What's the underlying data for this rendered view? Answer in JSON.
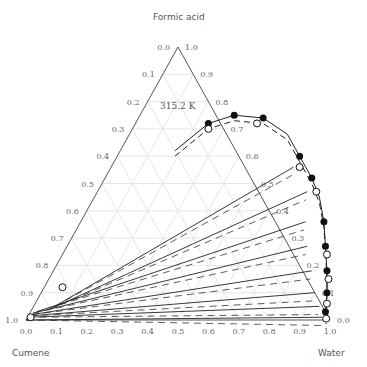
{
  "chart_data": {
    "type": "ternary-phase-diagram",
    "title": "",
    "temperature_label": "315.2 K",
    "vertices": {
      "top": "Formic acid",
      "left": "Cumene",
      "right": "Water"
    },
    "axes": {
      "bottom": {
        "ticks": [
          "0.0",
          "0.1",
          "0.2",
          "0.3",
          "0.4",
          "0.5",
          "0.6",
          "0.7",
          "0.8",
          "0.9",
          "1.0"
        ]
      },
      "left": {
        "ticks": [
          "0.0",
          "0.1",
          "0.2",
          "0.3",
          "0.4",
          "0.5",
          "0.6",
          "0.7",
          "0.8",
          "0.9",
          "1.0"
        ]
      },
      "right": {
        "ticks": [
          "1.0",
          "0.9",
          "0.8",
          "0.7",
          "0.6",
          "0.5",
          "0.4",
          "0.3",
          "0.2",
          "0.1",
          "0.0"
        ]
      }
    },
    "grid": true,
    "legend": {
      "filled_circle": "experimental tie-line ends",
      "open_circle": "calculated",
      "solid_line": "experimental tie lines",
      "dashed_line": "calculated tie lines"
    },
    "tie_lines_experimental": [
      {
        "left": [
          0.005,
          0.0
        ],
        "right": [
          0.975,
          0.005
        ]
      },
      {
        "left": [
          0.01,
          0.005
        ],
        "right": [
          0.96,
          0.02
        ]
      },
      {
        "left": [
          0.015,
          0.01
        ],
        "right": [
          0.94,
          0.05
        ]
      },
      {
        "left": [
          0.02,
          0.015
        ],
        "right": [
          0.915,
          0.08
        ]
      },
      {
        "left": [
          0.025,
          0.02
        ],
        "right": [
          0.89,
          0.12
        ]
      },
      {
        "left": [
          0.03,
          0.025
        ],
        "right": [
          0.865,
          0.17
        ]
      },
      {
        "left": [
          0.04,
          0.03
        ],
        "right": [
          0.84,
          0.23
        ]
      },
      {
        "left": [
          0.06,
          0.04
        ],
        "right": [
          0.815,
          0.29
        ]
      },
      {
        "left": [
          0.09,
          0.05
        ],
        "right": [
          0.785,
          0.37
        ]
      },
      {
        "left": [
          0.12,
          0.08
        ],
        "right": [
          0.745,
          0.46
        ]
      },
      {
        "left": [
          0.18,
          0.55
        ],
        "right": [
          0.68,
          0.58
        ]
      }
    ],
    "binodal_top": {
      "plait_region": [
        [
          0.36,
          0.72
        ],
        [
          0.45,
          0.76
        ],
        [
          0.56,
          0.75
        ],
        [
          0.66,
          0.67
        ],
        [
          0.76,
          0.58
        ]
      ]
    }
  }
}
